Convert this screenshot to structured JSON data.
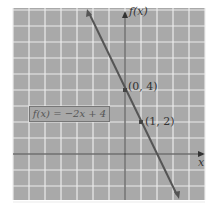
{
  "chart_data": {
    "type": "line",
    "title": "",
    "xlabel": "x",
    "ylabel": "f(x)",
    "xlim": [
      -7,
      5
    ],
    "ylim": [
      -3,
      9
    ],
    "grid": true,
    "series": [
      {
        "name": "f(x) = -2x + 4",
        "function": "-2x+4",
        "x": [
          -2.3,
          3.3
        ],
        "y": [
          8.6,
          -2.6
        ]
      }
    ],
    "points": [
      {
        "label": "(0, 4)",
        "x": 0,
        "y": 4
      },
      {
        "label": "(1, 2)",
        "x": 1,
        "y": 2
      }
    ],
    "annotations": [
      "f(x) = −2x + 4"
    ]
  },
  "labels": {
    "y_axis": "f(x)",
    "x_axis": "x",
    "point1": "(0, 4)",
    "point2": "(1, 2)",
    "equation": "f(x) = −2x + 4"
  },
  "colors": {
    "grid_bg": "#a9a9a9",
    "grid_line": "#ececec",
    "axis": "#333333",
    "line": "#555555"
  }
}
